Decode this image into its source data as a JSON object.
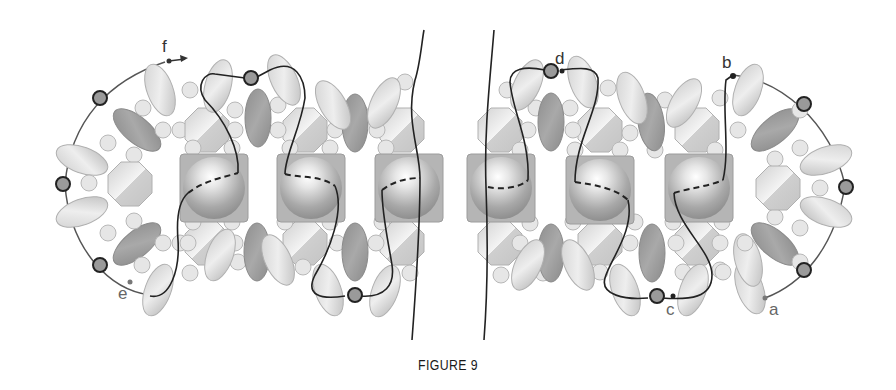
{
  "figure": {
    "caption": "FIGURE 9",
    "labels": {
      "a": "a",
      "b": "b",
      "c": "c",
      "d": "d",
      "e": "e",
      "f": "f"
    },
    "colors": {
      "thread": "#222222",
      "thread_outline": "#555555",
      "light_bead": "#d9d9d9",
      "dark_bead": "#9a9a9a",
      "seed_bead": "#e4e4e4",
      "cube_bead": "#a8a8a8",
      "octagon_bead": "#dcdcdc"
    },
    "bead_types": [
      "rice-oval-light",
      "rice-oval-dark",
      "seed-bead-round",
      "octagon-crystal",
      "pearl-in-square",
      "small-dark-round"
    ]
  }
}
